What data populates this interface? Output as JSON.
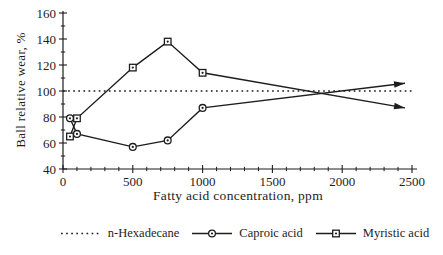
{
  "chart_data": {
    "type": "line",
    "title": "",
    "xlabel": "Fatty acid concentration, ppm",
    "ylabel": "Ball relative wear, %",
    "xlim": [
      0,
      2500
    ],
    "ylim": [
      40,
      160
    ],
    "x_major_ticks": [
      0,
      500,
      1000,
      1500,
      2000,
      2500
    ],
    "x_minor_step": 100,
    "y_major_ticks": [
      40,
      60,
      80,
      100,
      120,
      140,
      160
    ],
    "y_minor_step": 10,
    "grid": false,
    "legend_position": "bottom",
    "ink_color": "#1d1d1d",
    "series": [
      {
        "name": "n-Hexadecane",
        "style": "dotted",
        "marker": "none",
        "x": [
          0,
          2500
        ],
        "y": [
          100,
          100
        ]
      },
      {
        "name": "Caproic acid",
        "style": "solid",
        "marker": "circle",
        "x": [
          50,
          100,
          500,
          750,
          1000
        ],
        "y": [
          79,
          67,
          57,
          62,
          87
        ],
        "arrow_to": {
          "x": 2450,
          "y": 106
        }
      },
      {
        "name": "Myristic acid",
        "style": "solid",
        "marker": "square",
        "x": [
          50,
          100,
          500,
          750,
          1000
        ],
        "y": [
          65,
          79,
          118,
          138,
          114
        ],
        "arrow_to": {
          "x": 2450,
          "y": 87
        }
      }
    ]
  }
}
